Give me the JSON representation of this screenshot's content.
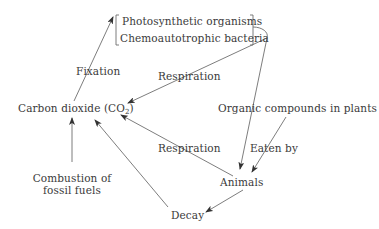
{
  "diagram": {
    "nodes": {
      "producers_group": {
        "items": [
          "Photosynthetic organisms",
          "Chemoautotrophic bacteria"
        ]
      },
      "co2": {
        "label": "Carbon dioxide (CO",
        "sub": "2",
        "close": ")"
      },
      "organic_compounds": {
        "label": "Organic compounds in plants"
      },
      "animals": {
        "label": "Animals"
      },
      "decay": {
        "label": "Decay"
      },
      "combustion": {
        "line1": "Combustion of",
        "line2": "fossil fuels"
      }
    },
    "edge_labels": {
      "fixation": "Fixation",
      "respiration_producers": "Respiration",
      "respiration_animals": "Respiration",
      "eaten_by": "Eaten by"
    },
    "edges": [
      {
        "from": "Carbon dioxide (CO2)",
        "to": "Photosynthetic organisms / Chemoautotrophic bacteria",
        "label": "Fixation"
      },
      {
        "from": "Photosynthetic organisms / Chemoautotrophic bacteria",
        "to": "Carbon dioxide (CO2)",
        "label": "Respiration"
      },
      {
        "from": "Photosynthetic organisms / Chemoautotrophic bacteria",
        "to": "Animals",
        "label": ""
      },
      {
        "from": "Organic compounds in plants",
        "to": "Animals",
        "label": "Eaten by"
      },
      {
        "from": "Animals",
        "to": "Carbon dioxide (CO2)",
        "label": "Respiration"
      },
      {
        "from": "Animals",
        "to": "Decay",
        "label": ""
      },
      {
        "from": "Decay",
        "to": "Carbon dioxide (CO2)",
        "label": ""
      },
      {
        "from": "Combustion of fossil fuels",
        "to": "Carbon dioxide (CO2)",
        "label": ""
      }
    ],
    "colors": {
      "line": "#6e6e6e",
      "text": "#3a3a3a",
      "background": "#ffffff"
    }
  }
}
